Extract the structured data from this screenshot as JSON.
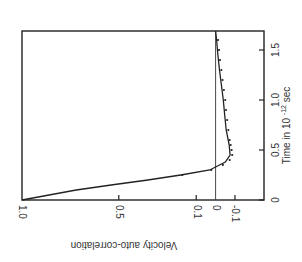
{
  "chart_data": {
    "type": "line",
    "title": "",
    "orientation": "rotated 90 degrees counter-clockwise (time axis vertical on right, correlation axis horizontal at bottom, text reads rotated)",
    "xlabel": "Time in 10^-12 sec",
    "xlabel_parts": {
      "base": "Time in 10",
      "exp": "-12",
      "unit": "sec"
    },
    "ylabel": "Velocity auto-correlation",
    "xlim": [
      0,
      1.69
    ],
    "ylim": [
      -0.25,
      1.0
    ],
    "x_ticks": [
      0,
      0.5,
      1.0,
      1.5
    ],
    "x_tick_labels": [
      "0",
      "0.5",
      "1.0",
      "1.5"
    ],
    "y_ticks": [
      1.0,
      0.5,
      0.1,
      0,
      -0.1
    ],
    "y_tick_labels": [
      "1.0",
      "0.5",
      "0.1",
      "0",
      "-0.1"
    ],
    "grid": false,
    "zero_line": true,
    "series": [
      {
        "name": "theory (solid line)",
        "style": "solid",
        "x": [
          0,
          0.05,
          0.1,
          0.15,
          0.2,
          0.25,
          0.3,
          0.33,
          0.38,
          0.45,
          0.55,
          0.7,
          0.85,
          1.0,
          1.15,
          1.3,
          1.45,
          1.6,
          1.69
        ],
        "values": [
          1.0,
          0.86,
          0.72,
          0.54,
          0.35,
          0.18,
          0.03,
          0.0,
          -0.05,
          -0.075,
          -0.07,
          -0.055,
          -0.047,
          -0.04,
          -0.03,
          -0.02,
          -0.012,
          -0.005,
          0.0
        ]
      },
      {
        "name": "simulation (dots)",
        "style": "dotted",
        "x": [
          0.25,
          0.3,
          0.35,
          0.4,
          0.45,
          0.5,
          0.55,
          0.6,
          0.7,
          0.8,
          0.9,
          1.0,
          1.1,
          1.2,
          1.3,
          1.4,
          1.5,
          1.6
        ],
        "values": [
          0.18,
          0.03,
          -0.03,
          -0.065,
          -0.078,
          -0.075,
          -0.07,
          -0.065,
          -0.058,
          -0.052,
          -0.046,
          -0.042,
          -0.035,
          -0.028,
          -0.022,
          -0.015,
          -0.01,
          -0.005
        ]
      }
    ]
  }
}
